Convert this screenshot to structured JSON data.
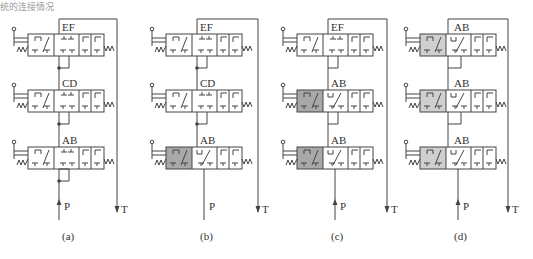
{
  "header": {
    "fragment_text": "统的连接情况"
  },
  "diagram": {
    "colors": {
      "line": "#444444",
      "shade": "#a8a8a8",
      "shade_light": "#cfcfcf"
    },
    "panels": [
      {
        "id": "a",
        "caption": "(a)",
        "x": 28,
        "frame_right": 117,
        "valves": [
          {
            "label": "EF",
            "shade": false
          },
          {
            "label": "CD",
            "shade": false
          },
          {
            "label": "AB",
            "shade": false
          }
        ],
        "p_label": "P",
        "t_label": "T"
      },
      {
        "id": "b",
        "caption": "(b)",
        "x": 166,
        "frame_right": 258,
        "valves": [
          {
            "label": "EF",
            "shade": false
          },
          {
            "label": "CD",
            "shade": false
          },
          {
            "label": "AB",
            "shade": true
          }
        ],
        "p_label": "P",
        "t_label": "T"
      },
      {
        "id": "c",
        "caption": "(c)",
        "x": 297,
        "frame_right": 387,
        "valves": [
          {
            "label": "EF",
            "shade": false
          },
          {
            "label": "AB",
            "shade": true
          },
          {
            "label": "AB",
            "shade": true
          }
        ],
        "p_label": "P",
        "t_label": "T"
      },
      {
        "id": "d",
        "caption": "(d)",
        "x": 420,
        "frame_right": 508,
        "valves": [
          {
            "label": "AB",
            "shade": true
          },
          {
            "label": "AB",
            "shade": true
          },
          {
            "label": "AB",
            "shade": true
          }
        ],
        "p_label": "P",
        "t_label": "T"
      }
    ]
  }
}
